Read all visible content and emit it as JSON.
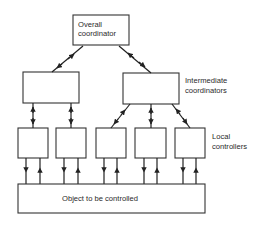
{
  "diagram": {
    "overall": {
      "line1": "Overall",
      "line2": "coordinator"
    },
    "intermediate_label": {
      "line1": "Intermediate",
      "line2": "coordinators"
    },
    "local_label": {
      "line1": "Local",
      "line2": "controllers"
    },
    "object_label": "Object to be controlled",
    "counts": {
      "intermediate_coordinators": 2,
      "local_controllers": 5
    },
    "colors": {
      "line": "#222222",
      "background": "#ffffff"
    }
  }
}
